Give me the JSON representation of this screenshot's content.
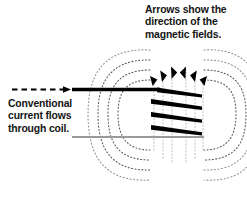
{
  "figure": {
    "background_color": "#ffffff",
    "width": 247,
    "height": 205
  },
  "captions": {
    "arrows_note": {
      "text": "Arrows show the\ndirection of the\nmagnetic fields.",
      "lines": [
        "Arrows show the",
        "direction of the",
        "magnetic fields."
      ],
      "color": "#141414"
    },
    "current_note": {
      "text": "Conventional\ncurrent flows\nthrough coil.",
      "lines": [
        "Conventional",
        "current flows",
        "through coil."
      ],
      "color": "#141414"
    }
  },
  "colors": {
    "wire_black": "#000000",
    "wire_gray": "#9a9a9a",
    "field_line": "#4a4a4a",
    "field_line_faint": "#b5b5b5",
    "arrow_black": "#000000",
    "text": "#141414"
  },
  "elements": {
    "current_arrow": {
      "name": "dashed-current-arrow",
      "style": "dashed",
      "direction": "right",
      "color": "#000000",
      "x_start": 12,
      "x_end": 72,
      "y": 90
    },
    "lead_in_wire": {
      "name": "lead-in-wire",
      "color": "#000000",
      "x_start": 72,
      "x_end": 157,
      "y": 90
    },
    "lead_out_wire": {
      "name": "lead-out-wire",
      "color": "#9a9a9a",
      "x_start": 72,
      "x_end": 200,
      "y": 137
    },
    "coil_turns": {
      "name": "coil-turns",
      "count": 4,
      "color": "#000000",
      "segments": [
        {
          "x1": 157,
          "y1": 90,
          "x2": 200,
          "y2": 96
        },
        {
          "x1": 152,
          "y1": 100,
          "x2": 200,
          "y2": 108
        },
        {
          "x1": 152,
          "y1": 113,
          "x2": 200,
          "y2": 120
        },
        {
          "x1": 152,
          "y1": 126,
          "x2": 200,
          "y2": 133
        }
      ]
    },
    "field_arrows": {
      "name": "field-direction-arrows",
      "count": 6,
      "direction": "up",
      "color": "#000000",
      "positions": [
        {
          "x": 153,
          "y": 78
        },
        {
          "x": 162,
          "y": 72
        },
        {
          "x": 172,
          "y": 68
        },
        {
          "x": 186,
          "y": 68
        },
        {
          "x": 195,
          "y": 71
        },
        {
          "x": 203,
          "y": 76
        }
      ]
    },
    "field_loops_left": {
      "name": "magnetic-field-lines-left",
      "count": 4,
      "style": "dotted",
      "center_x": 148,
      "center_y": 114,
      "radii_x": [
        18,
        26,
        34,
        42
      ],
      "radii_y": [
        34,
        48,
        60,
        72
      ]
    },
    "field_loops_right": {
      "name": "magnetic-field-lines-right",
      "count": 4,
      "style": "dotted",
      "center_x": 208,
      "center_y": 114,
      "radii_x": [
        18,
        26,
        34,
        42
      ],
      "radii_y": [
        34,
        48,
        60,
        72
      ]
    },
    "core_field_lines": {
      "name": "core-field-lines-vertical",
      "count": 6,
      "style": "dotted",
      "color": "#b5b5b5"
    }
  }
}
